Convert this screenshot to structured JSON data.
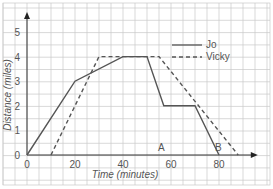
{
  "chart_data": {
    "type": "line",
    "title": "",
    "xlabel": "Time (minutes)",
    "ylabel": "Distance (miles)",
    "xlim": [
      0,
      90
    ],
    "ylim": [
      0,
      5.5
    ],
    "x_ticks": [
      "0",
      "20",
      "40",
      "60",
      "80"
    ],
    "y_ticks": [
      "0",
      "1",
      "2",
      "3",
      "4",
      "5"
    ],
    "grid": true,
    "legend_position": "upper right",
    "annotations": [
      {
        "text": "A",
        "x": 57,
        "y": 0.3
      },
      {
        "text": "B",
        "x": 77,
        "y": 0.3
      }
    ],
    "series": [
      {
        "name": "Jo",
        "style": "solid",
        "points": [
          [
            0,
            0
          ],
          [
            20,
            3
          ],
          [
            40,
            4
          ],
          [
            50,
            4
          ],
          [
            57,
            2
          ],
          [
            70,
            2
          ],
          [
            80,
            0
          ]
        ]
      },
      {
        "name": "Vicky",
        "style": "dashed",
        "points": [
          [
            10,
            0
          ],
          [
            30,
            4
          ],
          [
            55,
            4
          ],
          [
            88,
            0
          ]
        ]
      }
    ]
  },
  "legend": {
    "jo": "Jo",
    "vicky": "Vicky"
  },
  "labels": {
    "xlabel": "Time (minutes)",
    "ylabel": "Distance (miles)",
    "a": "A",
    "b": "B"
  }
}
